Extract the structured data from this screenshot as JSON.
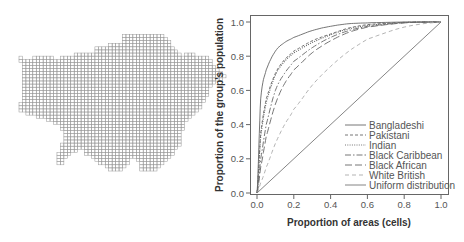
{
  "map": {
    "description": "Grid map of London divided into cells",
    "grid_color": "#9a9a9a"
  },
  "chart_data": {
    "type": "line",
    "title": "",
    "xlabel": "Proportion of areas (cells)",
    "ylabel": "Proportion of the group's population",
    "xlim": [
      0,
      1
    ],
    "ylim": [
      0,
      1
    ],
    "xticks": [
      "0.0",
      "0.2",
      "0.4",
      "0.6",
      "0.8",
      "1.0"
    ],
    "yticks": [
      "0.0",
      "0.2",
      "0.4",
      "0.6",
      "0.8",
      "1.0"
    ],
    "grid": false,
    "legend_position": "lower right",
    "x": [
      0,
      0.02,
      0.05,
      0.1,
      0.15,
      0.2,
      0.3,
      0.4,
      0.5,
      0.6,
      0.8,
      1.0
    ],
    "series": [
      {
        "name": "Bangladeshi",
        "style": "solid",
        "color": "#666666",
        "values": [
          0,
          0.55,
          0.72,
          0.83,
          0.88,
          0.91,
          0.95,
          0.975,
          0.99,
          0.995,
          1.0,
          1.0
        ]
      },
      {
        "name": "Pakistani",
        "style": "dashed-short",
        "color": "#666666",
        "values": [
          0,
          0.35,
          0.55,
          0.7,
          0.78,
          0.83,
          0.89,
          0.93,
          0.965,
          0.985,
          0.998,
          1.0
        ]
      },
      {
        "name": "Indian",
        "style": "dotted",
        "color": "#666666",
        "values": [
          0,
          0.33,
          0.53,
          0.69,
          0.77,
          0.82,
          0.88,
          0.925,
          0.96,
          0.98,
          0.997,
          1.0
        ]
      },
      {
        "name": "Black Caribbean",
        "style": "dash-dot",
        "color": "#666666",
        "values": [
          0,
          0.2,
          0.4,
          0.6,
          0.7,
          0.77,
          0.85,
          0.91,
          0.95,
          0.975,
          0.996,
          1.0
        ]
      },
      {
        "name": "Black African",
        "style": "dashed-long",
        "color": "#666666",
        "values": [
          0,
          0.15,
          0.33,
          0.52,
          0.64,
          0.72,
          0.82,
          0.89,
          0.94,
          0.97,
          0.995,
          1.0
        ]
      },
      {
        "name": "White British",
        "style": "dashed-light",
        "color": "#aaaaaa",
        "values": [
          0,
          0.06,
          0.15,
          0.29,
          0.4,
          0.49,
          0.63,
          0.74,
          0.83,
          0.9,
          0.97,
          1.0
        ]
      },
      {
        "name": "Uniform distribution",
        "style": "solid",
        "color": "#777777",
        "values": [
          0,
          0.02,
          0.05,
          0.1,
          0.15,
          0.2,
          0.3,
          0.4,
          0.5,
          0.6,
          0.8,
          1.0
        ]
      }
    ]
  }
}
